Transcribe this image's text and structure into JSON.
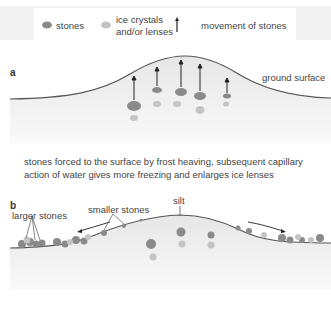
{
  "legend": {
    "stones": "stones",
    "ice_line1": "ice crystals",
    "ice_line2": "and/or lenses",
    "movement": "movement of stones"
  },
  "panel_a": {
    "label": "a",
    "ground_surface": "ground surface"
  },
  "caption": {
    "line1": "stones forced to the surface by frost heaving, subsequent capillary",
    "line2": "action of water gives more freezing and enlarges ice lenses"
  },
  "panel_b": {
    "label": "b",
    "silt": "silt",
    "smaller_stones": "smaller stones",
    "larger_stones": "larger stones"
  },
  "colors": {
    "stone": "#8a8a8a",
    "ice": "#c4c4c4",
    "soil": "#ebebeb",
    "surface_line": "#555555",
    "arrow": "#222222"
  }
}
